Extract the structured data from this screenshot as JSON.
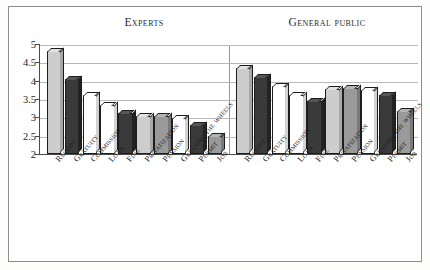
{
  "chart_data": {
    "type": "bar",
    "title": "",
    "xlabel": "",
    "ylabel": "",
    "ylim": [
      2,
      5
    ],
    "yticks": [
      "2",
      "2.5",
      "3",
      "3.5",
      "4",
      "4.5",
      "5"
    ],
    "grid": true,
    "legend_position": "none",
    "panels": [
      {
        "name": "experts",
        "title": "Experts",
        "categories": [
          "Receipt",
          "Gratuity",
          "Commission",
          "Loan",
          "Fine",
          "Privatization",
          "Pension",
          "Greasing the wheels",
          "Permit",
          "Job"
        ],
        "values": [
          4.8,
          4.05,
          3.6,
          3.35,
          3.12,
          3.05,
          3.05,
          2.98,
          2.8,
          2.5
        ],
        "fills": [
          "light",
          "dark",
          "white",
          "white",
          "dark",
          "light",
          "mid",
          "white",
          "dark",
          "mid"
        ]
      },
      {
        "name": "general-public",
        "title": "General public",
        "categories": [
          "Receipt",
          "Gratuity",
          "Commission",
          "Loan",
          "Fine",
          "Privatization",
          "Pension",
          "Greasing the wheels",
          "Permit",
          "Job"
        ],
        "values": [
          4.35,
          4.1,
          3.85,
          3.6,
          3.45,
          3.78,
          3.8,
          3.75,
          3.62,
          3.18
        ],
        "fills": [
          "light",
          "dark",
          "white",
          "white",
          "dark",
          "light",
          "mid",
          "white",
          "dark",
          "mid"
        ]
      }
    ],
    "colors": {
      "light": "#cdcdcd",
      "dark": "#3a3a3a",
      "white": "#ffffff",
      "mid": "#9a9a9a",
      "grid": "#b9b9b9",
      "axis": "#4a4a4a",
      "frame": "#8d8d8d",
      "text": "#1e1e1e"
    }
  }
}
